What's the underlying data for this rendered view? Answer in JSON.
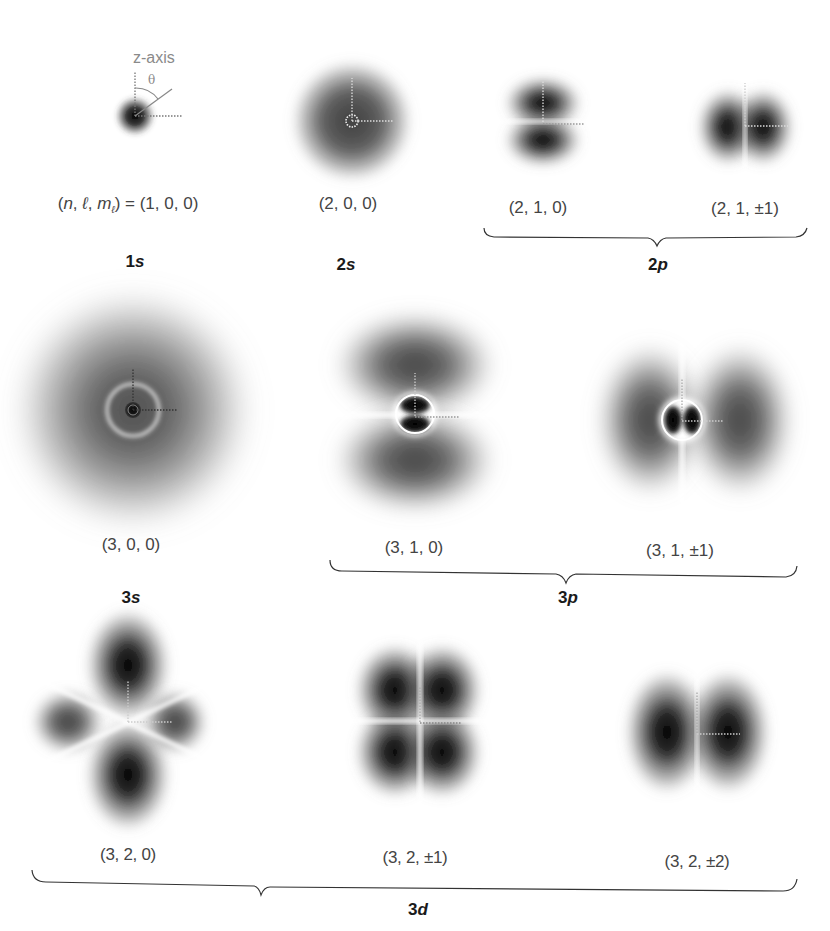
{
  "figure": {
    "axis_label": "z-axis",
    "angle_label": "θ",
    "rows": [
      {
        "orbitals": [
          {
            "id": "1s",
            "label": "(n, ℓ, mℓ) = (1, 0, 0)",
            "shape": "1s"
          },
          {
            "id": "2s",
            "label": "(2, 0, 0)",
            "shape": "2s"
          },
          {
            "id": "2p0",
            "label": "(2, 1, 0)",
            "shape": "2p-m0"
          },
          {
            "id": "2p1",
            "label": "(2, 1, ±1)",
            "shape": "2p-m1"
          }
        ],
        "groups": [
          {
            "name": "1s",
            "n": "1",
            "l": "s"
          },
          {
            "name": "2s",
            "n": "2",
            "l": "s"
          },
          {
            "name": "2p",
            "n": "2",
            "l": "p",
            "bracket": true
          }
        ]
      },
      {
        "orbitals": [
          {
            "id": "3s",
            "label": "(3, 0, 0)",
            "shape": "3s"
          },
          {
            "id": "3p0",
            "label": "(3, 1, 0)",
            "shape": "3p-m0"
          },
          {
            "id": "3p1",
            "label": "(3, 1, ±1)",
            "shape": "3p-m1"
          }
        ],
        "groups": [
          {
            "name": "3s",
            "n": "3",
            "l": "s"
          },
          {
            "name": "3p",
            "n": "3",
            "l": "p",
            "bracket": true
          }
        ]
      },
      {
        "orbitals": [
          {
            "id": "3d0",
            "label": "(3, 2, 0)",
            "shape": "3d-m0"
          },
          {
            "id": "3d1",
            "label": "(3, 2, ±1)",
            "shape": "3d-m1"
          },
          {
            "id": "3d2",
            "label": "(3, 2, ±2)",
            "shape": "3d-m2"
          }
        ],
        "groups": [
          {
            "name": "3d",
            "n": "3",
            "l": "d",
            "bracket": true
          }
        ]
      }
    ]
  },
  "labels": {
    "qn_1s_prefix": "(n, ℓ, mℓ)",
    "qn_1s_n": "n",
    "qn_1s_l": "ℓ",
    "qn_1s_m": "m",
    "qn_1s_msub": "ℓ",
    "qn_1s_value": " = (1, 0, 0)"
  }
}
